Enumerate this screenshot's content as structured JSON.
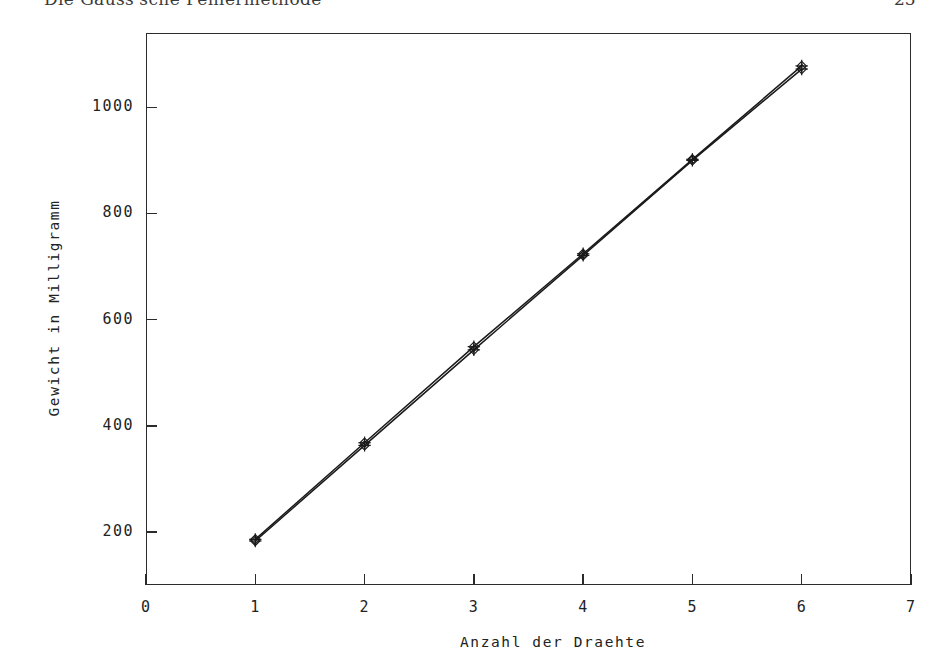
{
  "page": {
    "header_title": "Die Gauss'sche Fehlermethode",
    "folio": "25"
  },
  "chart_data": {
    "type": "line",
    "title": "",
    "subtitle": "",
    "xlabel": "Anzahl der Draehte",
    "ylabel": "Gewicht in Milligramm",
    "xlim": [
      0,
      7
    ],
    "ylim": [
      100,
      1140
    ],
    "xticks": [
      0,
      1,
      2,
      3,
      4,
      5,
      6,
      7
    ],
    "xtick_labels": [
      "0",
      "1",
      "2",
      "3",
      "4",
      "5",
      "6",
      "7"
    ],
    "yticks": [
      200,
      400,
      600,
      800,
      1000
    ],
    "ytick_labels": [
      "200",
      "400",
      "600",
      "800",
      "1000"
    ],
    "grid": false,
    "legend": "none",
    "marker": "diamond-with-cross",
    "line_color": "#1a1a1a",
    "x": [
      1,
      2,
      3,
      4,
      5,
      6
    ],
    "series": [
      {
        "name": "Messwerte",
        "values": [
          183,
          363,
          543,
          721,
          900,
          1072
        ]
      },
      {
        "name": "Ausgleichsgerade",
        "values": [
          186,
          368,
          549,
          724,
          902,
          1078
        ]
      }
    ]
  }
}
